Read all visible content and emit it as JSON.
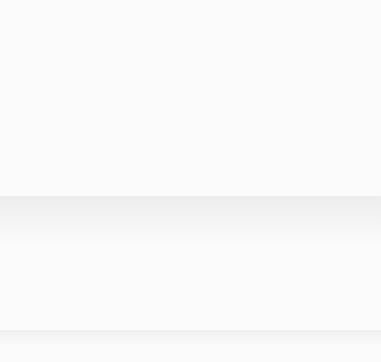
{
  "figure": {
    "page_background": "#fbfbfb",
    "plot_background": "#d6d6d6",
    "gridline_color": "#f2f2f2",
    "axis_color": "#4a4a4a",
    "series_color": "#5a5a5a"
  },
  "chart_data": {
    "type": "line",
    "title": "",
    "subtitle": "",
    "xlabel": "Year",
    "ylabel": "Annual percent increase",
    "xlim": [
      1948,
      2056
    ],
    "ylim": [
      0,
      2.32
    ],
    "xticks": [
      1950,
      1975,
      2000,
      2025,
      2050
    ],
    "xticklabels": [
      "1950",
      "1975",
      "2000",
      "2025",
      "2050"
    ],
    "yticks": [
      0,
      0.2,
      0.4,
      0.6,
      0.8,
      1.0,
      1.2,
      1.4,
      1.6,
      1.8,
      2.0,
      2.2
    ],
    "yticklabels": [
      "0",
      "0.2",
      "0.4",
      "0.6",
      "0.8",
      "1.0",
      "1.2",
      "1.4",
      "1.6",
      "1.8",
      "2.0",
      "2.2"
    ],
    "grid": true,
    "grid_color": "#f2f2f2",
    "legend": "none",
    "series": [
      {
        "name": "Observed data",
        "style": "solid",
        "color": "#5a5a5a",
        "x": [
          1949,
          1950,
          1951,
          1952,
          1953,
          1954,
          1955,
          1956,
          1957,
          1958,
          1959,
          1960,
          1961,
          1962,
          1963,
          1964,
          1965,
          1966,
          1967,
          1968,
          1969,
          1970,
          1971,
          1972,
          1973,
          1974,
          1975,
          1976,
          1977,
          1978,
          1979,
          1980,
          1981,
          1982,
          1983,
          1984,
          1985,
          1986,
          1987,
          1988,
          1989,
          1990,
          1991,
          1992,
          1993,
          1994,
          1995,
          1996,
          1997,
          1998,
          1999,
          2000,
          2001,
          2002,
          2003,
          2004,
          2005
        ],
        "y": [
          1.57,
          1.72,
          1.86,
          1.95,
          1.97,
          2.0,
          2.06,
          2.0,
          1.85,
          1.62,
          1.42,
          1.85,
          2.29,
          2.25,
          2.2,
          2.12,
          2.19,
          2.15,
          2.21,
          2.17,
          2.1,
          2.03,
          1.97,
          1.9,
          1.83,
          1.82,
          1.85,
          1.79,
          1.84,
          1.8,
          1.87,
          1.81,
          1.8,
          1.83,
          1.82,
          1.81,
          1.83,
          1.8,
          1.73,
          1.65,
          1.6,
          1.56,
          1.53,
          1.5,
          1.47,
          1.46,
          1.43,
          1.4,
          1.37,
          1.33,
          1.3,
          1.28,
          1.25,
          1.22,
          1.2,
          1.2,
          1.19
        ]
      },
      {
        "name": "Projected data",
        "style": "dashed",
        "color": "#5a5a5a",
        "x": [
          2005,
          2010,
          2015,
          2020,
          2025,
          2030,
          2035,
          2040,
          2045,
          2050
        ],
        "y": [
          1.18,
          1.1,
          1.01,
          0.94,
          0.86,
          0.76,
          0.67,
          0.57,
          0.48,
          0.4
        ]
      }
    ],
    "annotations": [
      {
        "label": "2005",
        "points_to_x": 2005,
        "points_to_y": 1.18,
        "note": "leader line from label to end of solid curve"
      },
      {
        "label": "Projected\ndata",
        "label_line1": "Projected",
        "label_line2": "data",
        "points_to_x": 2019,
        "points_to_y": 0.95,
        "note": "leader line from label to dashed curve"
      }
    ]
  }
}
